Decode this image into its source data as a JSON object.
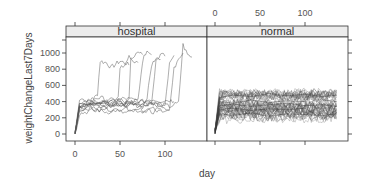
{
  "chart_data": {
    "type": "line",
    "title": "",
    "xlabel": "day",
    "ylabel": "weightChangeLast7Days",
    "layout": "lattice xyplot, 2 panels side by side, shared y axis",
    "grid": false,
    "legend": null,
    "ylim": [
      -50,
      1200
    ],
    "yticks": [
      0,
      200,
      400,
      600,
      800,
      1000
    ],
    "ytick_labels": [
      "0",
      "200",
      "400",
      "600",
      "800",
      "1000"
    ],
    "xlim": [
      -10,
      150
    ],
    "xticks": [
      0,
      50,
      100
    ],
    "xtick_labels": [
      "0",
      "50",
      "100"
    ],
    "colors": {
      "strip_bg": "#ececec",
      "lines": "#555555",
      "frame": "#333333"
    },
    "panels": [
      {
        "name": "hospital",
        "strip_label": "hospital",
        "x_axis_labels_position": "bottom",
        "description": "Many series start near 0 at day 0, rise to ~300-450 by day 5, then fluctuate 250-500; individual series jump to ~800-1100 at staggered days between ~25 and ~115.",
        "series": [
          {
            "name": "s1",
            "x": [
              0,
              5,
              10,
              20,
              25,
              28,
              35,
              40,
              45,
              50,
              55,
              60
            ],
            "y": [
              0,
              350,
              380,
              420,
              500,
              900,
              880,
              820,
              860,
              900,
              880,
              850
            ]
          },
          {
            "name": "s2",
            "x": [
              0,
              5,
              10,
              20,
              30,
              40,
              48,
              50,
              55,
              60,
              65,
              70
            ],
            "y": [
              20,
              330,
              360,
              400,
              380,
              420,
              450,
              800,
              850,
              950,
              900,
              880
            ]
          },
          {
            "name": "s3",
            "x": [
              0,
              5,
              10,
              20,
              30,
              40,
              50,
              55,
              60,
              62,
              70,
              75
            ],
            "y": [
              10,
              360,
              340,
              380,
              400,
              370,
              420,
              390,
              410,
              950,
              1000,
              980
            ]
          },
          {
            "name": "s4",
            "x": [
              0,
              5,
              15,
              25,
              35,
              45,
              55,
              65,
              70,
              75,
              80,
              85
            ],
            "y": [
              0,
              300,
              350,
              330,
              360,
              380,
              350,
              400,
              420,
              900,
              1050,
              980
            ]
          },
          {
            "name": "s5",
            "x": [
              0,
              5,
              15,
              25,
              35,
              45,
              55,
              65,
              75,
              80,
              85,
              90,
              95
            ],
            "y": [
              30,
              380,
              400,
              360,
              390,
              410,
              370,
              380,
              400,
              430,
              850,
              950,
              920
            ]
          },
          {
            "name": "s6",
            "x": [
              0,
              5,
              15,
              25,
              35,
              45,
              55,
              65,
              75,
              85,
              90,
              95,
              100
            ],
            "y": [
              0,
              340,
              360,
              380,
              350,
              370,
              400,
              390,
              360,
              380,
              900,
              980,
              960
            ]
          },
          {
            "name": "s7",
            "x": [
              0,
              5,
              15,
              25,
              35,
              45,
              55,
              65,
              75,
              85,
              95,
              100,
              105,
              110
            ],
            "y": [
              10,
              320,
              350,
              370,
              360,
              380,
              340,
              360,
              390,
              370,
              350,
              380,
              850,
              970
            ]
          },
          {
            "name": "s8",
            "x": [
              0,
              5,
              15,
              25,
              35,
              45,
              55,
              65,
              75,
              85,
              95,
              105,
              110,
              115,
              120
            ],
            "y": [
              0,
              350,
              380,
              360,
              340,
              370,
              390,
              360,
              340,
              380,
              360,
              300,
              800,
              950,
              1000
            ]
          },
          {
            "name": "s9",
            "x": [
              0,
              5,
              15,
              25,
              35,
              45,
              55,
              65,
              75,
              85,
              95,
              105,
              115,
              120,
              125,
              130
            ],
            "y": [
              20,
              360,
              340,
              380,
              400,
              350,
              370,
              380,
              360,
              390,
              370,
              340,
              380,
              1100,
              980,
              950
            ]
          },
          {
            "name": "s10",
            "x": [
              0,
              5,
              15,
              25,
              35,
              45,
              55,
              65,
              75,
              85,
              95,
              105
            ],
            "y": [
              0,
              300,
              320,
              280,
              310,
              290,
              330,
              300,
              280,
              310,
              300,
              290
            ]
          },
          {
            "name": "s11",
            "x": [
              0,
              5,
              15,
              25,
              35,
              45,
              55,
              65,
              75,
              85,
              95,
              105,
              110
            ],
            "y": [
              10,
              400,
              420,
              450,
              430,
              410,
              440,
              420,
              400,
              430,
              410,
              420,
              400
            ]
          },
          {
            "name": "s12",
            "x": [
              0,
              5,
              15,
              25,
              35,
              45,
              55,
              65,
              75,
              85,
              95
            ],
            "y": [
              0,
              250,
              280,
              300,
              270,
              290,
              260,
              280,
              300,
              270,
              290
            ]
          }
        ]
      },
      {
        "name": "normal",
        "strip_label": "normal",
        "x_axis_labels_position": "top",
        "description": "Dense band: all series start near 0 at day 0, rise to ~200-500 by day 5, and stay within ~150-550 through day ~135.",
        "band": {
          "x_start": 0,
          "x_rise_end": 5,
          "x_end": 135,
          "y_low": 180,
          "y_high": 520,
          "y_center": 350
        },
        "series": [
          {
            "name": "n1",
            "x": [
              0,
              5,
              20,
              40,
              60,
              80,
              100,
              120,
              135
            ],
            "y": [
              0,
              450,
              480,
              460,
              500,
              470,
              490,
              460,
              480
            ]
          },
          {
            "name": "n2",
            "x": [
              0,
              5,
              20,
              40,
              60,
              80,
              100,
              120,
              135
            ],
            "y": [
              10,
              250,
              230,
              260,
              220,
              250,
              240,
              230,
              250
            ]
          },
          {
            "name": "n3",
            "x": [
              0,
              5,
              20,
              40,
              60,
              80,
              100,
              120,
              135
            ],
            "y": [
              0,
              350,
              370,
              340,
              360,
              380,
              350,
              360,
              340
            ]
          },
          {
            "name": "n4",
            "x": [
              0,
              5,
              20,
              40,
              60,
              80,
              100,
              110,
              120,
              135
            ],
            "y": [
              20,
              400,
              380,
              420,
              390,
              410,
              400,
              560,
              420,
              400
            ]
          },
          {
            "name": "n5",
            "x": [
              0,
              5,
              20,
              40,
              60,
              80,
              100,
              120,
              135
            ],
            "y": [
              0,
              300,
              320,
              290,
              310,
              300,
              320,
              180,
              300
            ]
          }
        ]
      }
    ]
  }
}
